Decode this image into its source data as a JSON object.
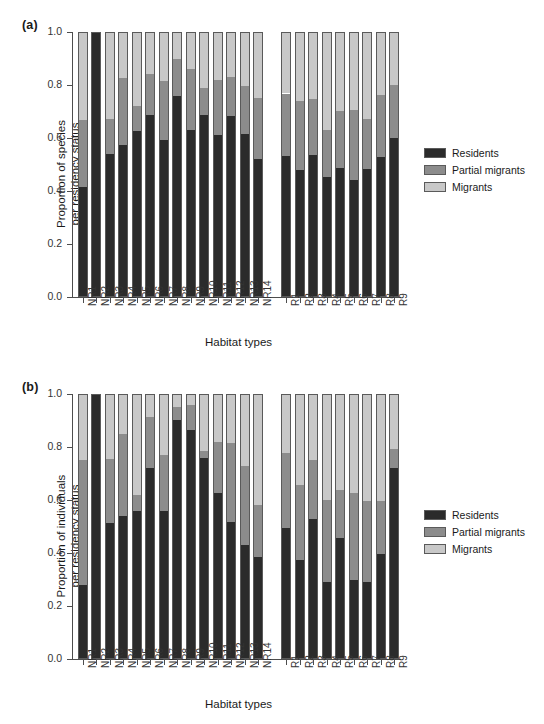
{
  "figure": {
    "panels": [
      {
        "tag": "(a)",
        "ylabel": "Proportion of species\nper residency status",
        "xlabel": "Habitat types"
      },
      {
        "tag": "(b)",
        "ylabel": "Proportion of individuals\nper residency status",
        "xlabel": "Habitat types"
      }
    ],
    "legend": {
      "items": [
        {
          "label": "Residents",
          "color": "#2b2b2b"
        },
        {
          "label": "Partial migrants",
          "color": "#8c8c8c"
        },
        {
          "label": "Migrants",
          "color": "#c8c8c8"
        }
      ]
    },
    "yticks": [
      "0.0",
      "0.2",
      "0.4",
      "0.6",
      "0.8",
      "1.0"
    ]
  },
  "chart_data": [
    {
      "type": "bar",
      "subtype": "stacked-proportional",
      "panel": "(a)",
      "title": "",
      "xlabel": "Habitat types",
      "ylabel": "Proportion of species per residency status",
      "ylim": [
        0.0,
        1.0
      ],
      "yticks": [
        0.0,
        0.2,
        0.4,
        0.6,
        0.8,
        1.0
      ],
      "grid": false,
      "legend_position": "right",
      "categories": [
        "NR1",
        "NR2",
        "NR3",
        "NR4",
        "NR5",
        "NR6",
        "NR7",
        "NR8",
        "NR9",
        "NR10",
        "NR11",
        "NR12",
        "NR13",
        "NR14",
        "R1",
        "R2",
        "R3",
        "R4",
        "R5",
        "R6",
        "R7",
        "R8",
        "R9"
      ],
      "group_gap_after": "NR14",
      "series": [
        {
          "name": "Residents",
          "color": "#2b2b2b",
          "values": [
            0.415,
            1.0,
            0.54,
            0.575,
            0.625,
            0.685,
            0.592,
            0.757,
            0.632,
            0.685,
            0.613,
            0.683,
            0.615,
            0.522,
            0.533,
            0.478,
            0.537,
            0.452,
            0.485,
            0.44,
            0.482,
            0.53,
            0.6
          ]
        },
        {
          "name": "Partial migrants",
          "color": "#8c8c8c",
          "values": [
            0.252,
            0.0,
            0.13,
            0.25,
            0.095,
            0.155,
            0.222,
            0.14,
            0.228,
            0.105,
            0.205,
            0.147,
            0.18,
            0.228,
            0.235,
            0.262,
            0.212,
            0.178,
            0.218,
            0.267,
            0.19,
            0.233,
            0.2
          ]
        },
        {
          "name": "Migrants",
          "color": "#c8c8c8",
          "values": [
            0.333,
            0.0,
            0.33,
            0.175,
            0.28,
            0.16,
            0.186,
            0.103,
            0.14,
            0.21,
            0.182,
            0.17,
            0.205,
            0.25,
            0.232,
            0.26,
            0.251,
            0.37,
            0.297,
            0.293,
            0.328,
            0.237,
            0.2
          ]
        }
      ]
    },
    {
      "type": "bar",
      "subtype": "stacked-proportional",
      "panel": "(b)",
      "title": "",
      "xlabel": "Habitat types",
      "ylabel": "Proportion of individuals per residency status",
      "ylim": [
        0.0,
        1.0
      ],
      "yticks": [
        0.0,
        0.2,
        0.4,
        0.6,
        0.8,
        1.0
      ],
      "grid": false,
      "legend_position": "right",
      "categories": [
        "NR1",
        "NR2",
        "NR3",
        "NR4",
        "NR5",
        "NR6",
        "NR7",
        "NR8",
        "NR9",
        "NR10",
        "NR11",
        "NR12",
        "NR13",
        "NR14",
        "R1",
        "R2",
        "R3",
        "R4",
        "R5",
        "R6",
        "R7",
        "R8",
        "R9"
      ],
      "group_gap_after": "NR14",
      "series": [
        {
          "name": "Residents",
          "color": "#2b2b2b",
          "values": [
            0.28,
            1.0,
            0.512,
            0.538,
            0.558,
            0.72,
            0.558,
            0.902,
            0.865,
            0.76,
            0.625,
            0.518,
            0.432,
            0.385,
            0.493,
            0.373,
            0.528,
            0.292,
            0.455,
            0.297,
            0.29,
            0.398,
            0.722
          ]
        },
        {
          "name": "Partial migrants",
          "color": "#8c8c8c",
          "values": [
            0.47,
            0.0,
            0.243,
            0.31,
            0.062,
            0.192,
            0.212,
            0.048,
            0.092,
            0.025,
            0.195,
            0.298,
            0.298,
            0.195,
            0.285,
            0.285,
            0.222,
            0.308,
            0.182,
            0.328,
            0.308,
            0.2,
            0.07
          ]
        },
        {
          "name": "Migrants",
          "color": "#c8c8c8",
          "values": [
            0.25,
            0.0,
            0.245,
            0.152,
            0.38,
            0.088,
            0.23,
            0.05,
            0.043,
            0.215,
            0.18,
            0.184,
            0.27,
            0.42,
            0.222,
            0.342,
            0.25,
            0.4,
            0.363,
            0.375,
            0.402,
            0.402,
            0.208
          ]
        }
      ]
    }
  ]
}
